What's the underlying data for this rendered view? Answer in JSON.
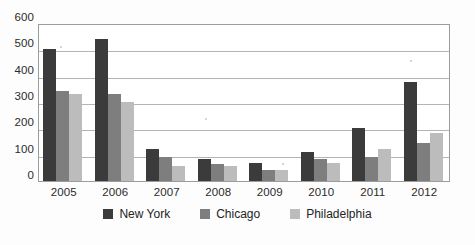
{
  "chart_data": {
    "type": "bar",
    "title": "",
    "xlabel": "",
    "ylabel": "",
    "categories": [
      "2005",
      "2006",
      "2007",
      "2008",
      "2009",
      "2010",
      "2011",
      "2012"
    ],
    "series": [
      {
        "name": "New York",
        "color": "#3b3b3b",
        "values": [
          500,
          540,
          120,
          85,
          70,
          112,
          202,
          377
        ]
      },
      {
        "name": "Chicago",
        "color": "#7e7e7e",
        "values": [
          340,
          330,
          90,
          65,
          42,
          83,
          93,
          143
        ]
      },
      {
        "name": "Philadelphia",
        "color": "#bcbcbc",
        "values": [
          330,
          300,
          57,
          57,
          42,
          68,
          123,
          182
        ]
      }
    ],
    "ylim": [
      0,
      600
    ],
    "ytick_step": 100,
    "yticks": [
      "600",
      "500",
      "400",
      "300",
      "200",
      "100",
      "0"
    ],
    "grid": "horizontal",
    "legend_position": "bottom"
  },
  "legend": {
    "items": [
      {
        "label": "New York"
      },
      {
        "label": "Chicago"
      },
      {
        "label": "Philadelphia"
      }
    ]
  }
}
